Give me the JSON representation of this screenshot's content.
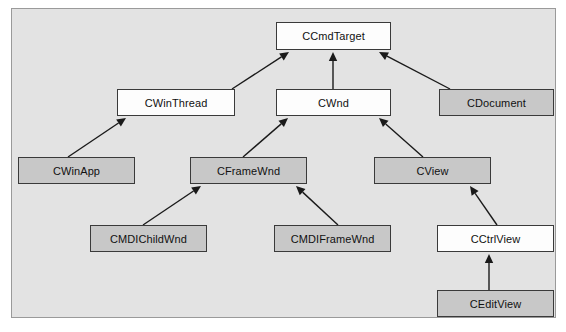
{
  "diagram": {
    "type": "class-hierarchy",
    "frame": {
      "background_color": "#e3e3e3",
      "border_color": "#9a9a9a"
    },
    "style": {
      "white_fill": "#fdfdfd",
      "gray_fill": "#c8c8c8",
      "box_border_color": "#3a3a3a",
      "edge_color": "#1a1a1a"
    },
    "nodes": [
      {
        "id": "ccmdtarget",
        "label": "CCmdTarget",
        "fill": "white",
        "x": 276,
        "y": 22,
        "w": 115,
        "h": 28
      },
      {
        "id": "cwinthread",
        "label": "CWinThread",
        "fill": "white",
        "x": 117,
        "y": 89,
        "w": 118,
        "h": 27
      },
      {
        "id": "cwnd",
        "label": "CWnd",
        "fill": "white",
        "x": 276,
        "y": 89,
        "w": 115,
        "h": 27
      },
      {
        "id": "cdocument",
        "label": "CDocument",
        "fill": "gray",
        "x": 439,
        "y": 89,
        "w": 115,
        "h": 27
      },
      {
        "id": "cwinapp",
        "label": "CWinApp",
        "fill": "gray",
        "x": 18,
        "y": 157,
        "w": 117,
        "h": 27
      },
      {
        "id": "cframewnd",
        "label": "CFrameWnd",
        "fill": "gray",
        "x": 190,
        "y": 157,
        "w": 117,
        "h": 27
      },
      {
        "id": "cview",
        "label": "CView",
        "fill": "gray",
        "x": 374,
        "y": 157,
        "w": 117,
        "h": 27
      },
      {
        "id": "cmdichildwnd",
        "label": "CMDIChildWnd",
        "fill": "gray",
        "x": 90,
        "y": 225,
        "w": 117,
        "h": 27
      },
      {
        "id": "cmdiframewnd",
        "label": "CMDIFrameWnd",
        "fill": "gray",
        "x": 274,
        "y": 225,
        "w": 117,
        "h": 27
      },
      {
        "id": "cctrlview",
        "label": "CCtrlView",
        "fill": "white",
        "x": 437,
        "y": 225,
        "w": 117,
        "h": 27
      },
      {
        "id": "ceditview",
        "label": "CEditView",
        "fill": "gray",
        "x": 437,
        "y": 290,
        "w": 117,
        "h": 27
      }
    ],
    "edges": [
      {
        "from": "cwinthread",
        "to": "ccmdtarget",
        "x1": 232,
        "y1": 89,
        "x2": 289,
        "y2": 52
      },
      {
        "from": "cwnd",
        "to": "ccmdtarget",
        "x1": 333,
        "y1": 89,
        "x2": 333,
        "y2": 52
      },
      {
        "from": "cdocument",
        "to": "ccmdtarget",
        "x1": 450,
        "y1": 89,
        "x2": 379,
        "y2": 52
      },
      {
        "from": "cwinapp",
        "to": "cwinthread",
        "x1": 68,
        "y1": 157,
        "x2": 126,
        "y2": 118
      },
      {
        "from": "cframewnd",
        "to": "cwnd",
        "x1": 243,
        "y1": 157,
        "x2": 288,
        "y2": 118
      },
      {
        "from": "cview",
        "to": "cwnd",
        "x1": 423,
        "y1": 157,
        "x2": 379,
        "y2": 118
      },
      {
        "from": "cmdichildwnd",
        "to": "cframewnd",
        "x1": 143,
        "y1": 225,
        "x2": 201,
        "y2": 186
      },
      {
        "from": "cmdiframewnd",
        "to": "cframewnd",
        "x1": 338,
        "y1": 225,
        "x2": 296,
        "y2": 186
      },
      {
        "from": "cctrlview",
        "to": "cview",
        "x1": 497,
        "y1": 225,
        "x2": 470,
        "y2": 186
      },
      {
        "from": "ceditview",
        "to": "cctrlview",
        "x1": 489,
        "y1": 290,
        "x2": 489,
        "y2": 254
      }
    ]
  }
}
